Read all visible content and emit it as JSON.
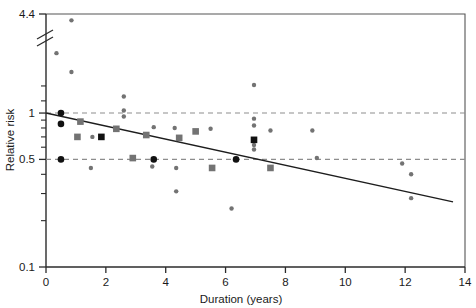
{
  "chart_data": {
    "type": "scatter",
    "title": "",
    "xlabel": "Duration (years)",
    "ylabel": "Relative risk",
    "xlim": [
      0,
      14
    ],
    "ylim": [
      0.1,
      4.4
    ],
    "yscale": "log",
    "grid": false,
    "legend_position": "none",
    "y_axis_break": true,
    "y_axis_break_note": "axis break drawn between 4.4 and the next labelled value",
    "xticks": [
      0,
      2,
      4,
      6,
      8,
      10,
      12,
      14
    ],
    "xtick_labels": [
      "0",
      "2",
      "4",
      "6",
      "8",
      "10",
      "12",
      "14"
    ],
    "yticks": [
      0.1,
      0.5,
      1,
      4.4
    ],
    "ytick_labels": [
      "0.1",
      "0.5",
      "1",
      "4.4"
    ],
    "ytick_minor": [
      0.2,
      0.3,
      0.4,
      0.6,
      0.7,
      0.8,
      0.9,
      1.2,
      1.5
    ],
    "reference_lines": [
      {
        "y": 1,
        "style": "dashed",
        "color": "#8d8d8d"
      },
      {
        "y": 0.5,
        "style": "dashed",
        "color": "#8d8d8d"
      }
    ],
    "fit_line": {
      "label": "fitted regression line",
      "x_start": 0.0,
      "y_start": 1.0,
      "x_end": 13.6,
      "y_end": 0.265,
      "color": "#1d1d1d"
    },
    "series": [
      {
        "name": "small gray circles",
        "marker": "circle",
        "color": "#737373",
        "size": "small",
        "points": [
          {
            "x": 0.85,
            "y": 4.0
          },
          {
            "x": 0.35,
            "y": 2.45
          },
          {
            "x": 0.85,
            "y": 1.85
          },
          {
            "x": 2.6,
            "y": 1.28
          },
          {
            "x": 2.6,
            "y": 1.04
          },
          {
            "x": 2.6,
            "y": 0.95
          },
          {
            "x": 1.55,
            "y": 0.7
          },
          {
            "x": 3.6,
            "y": 0.81
          },
          {
            "x": 4.3,
            "y": 0.8
          },
          {
            "x": 5.5,
            "y": 0.79
          },
          {
            "x": 6.95,
            "y": 1.52
          },
          {
            "x": 6.95,
            "y": 0.92
          },
          {
            "x": 6.95,
            "y": 0.83
          },
          {
            "x": 6.95,
            "y": 0.62
          },
          {
            "x": 6.95,
            "y": 0.58
          },
          {
            "x": 7.5,
            "y": 0.77
          },
          {
            "x": 8.9,
            "y": 0.77
          },
          {
            "x": 9.05,
            "y": 0.51
          },
          {
            "x": 1.5,
            "y": 0.44
          },
          {
            "x": 3.55,
            "y": 0.45
          },
          {
            "x": 4.35,
            "y": 0.44
          },
          {
            "x": 4.35,
            "y": 0.31
          },
          {
            "x": 5.55,
            "y": 0.44
          },
          {
            "x": 6.2,
            "y": 0.24
          },
          {
            "x": 11.9,
            "y": 0.47
          },
          {
            "x": 12.2,
            "y": 0.4
          },
          {
            "x": 12.2,
            "y": 0.28
          }
        ]
      },
      {
        "name": "gray squares",
        "marker": "square",
        "color": "#737373",
        "size": "medium",
        "points": [
          {
            "x": 1.15,
            "y": 0.88
          },
          {
            "x": 2.35,
            "y": 0.79
          },
          {
            "x": 1.05,
            "y": 0.7
          },
          {
            "x": 3.35,
            "y": 0.72
          },
          {
            "x": 4.45,
            "y": 0.69
          },
          {
            "x": 5.0,
            "y": 0.76
          },
          {
            "x": 2.9,
            "y": 0.51
          },
          {
            "x": 5.55,
            "y": 0.44
          },
          {
            "x": 7.5,
            "y": 0.44
          }
        ]
      },
      {
        "name": "black circles",
        "marker": "circle",
        "color": "#111111",
        "size": "medium",
        "points": [
          {
            "x": 0.5,
            "y": 1.0
          },
          {
            "x": 0.5,
            "y": 0.85
          },
          {
            "x": 0.5,
            "y": 0.5
          },
          {
            "x": 3.6,
            "y": 0.5
          },
          {
            "x": 6.35,
            "y": 0.5
          }
        ]
      },
      {
        "name": "black squares",
        "marker": "square",
        "color": "#111111",
        "size": "medium",
        "points": [
          {
            "x": 1.85,
            "y": 0.7
          },
          {
            "x": 6.95,
            "y": 0.67
          }
        ]
      }
    ]
  }
}
